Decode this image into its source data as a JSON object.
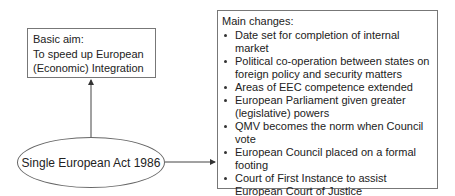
{
  "diagram": {
    "aim_box": {
      "title": "Basic aim:",
      "body": "To speed up European (Economic) Integration"
    },
    "center_node": {
      "label": "Single European Act 1986"
    },
    "changes_box": {
      "title": "Main changes:",
      "items": [
        "Date set for completion of internal market",
        "Political co-operation between states on foreign policy and security matters",
        "Areas of EEC competence extended",
        "European Parliament given greater (legislative) powers",
        "QMV becomes the norm when Council vote",
        "European Council placed on a formal footing",
        "Court of First Instance to assist European Court of Justice"
      ]
    },
    "edges": [
      {
        "from": "center_node",
        "to": "aim_box",
        "direction": "up"
      },
      {
        "from": "center_node",
        "to": "changes_box",
        "direction": "right"
      }
    ],
    "colors": {
      "border": "#777777",
      "text": "#222222",
      "background": "#ffffff"
    }
  }
}
